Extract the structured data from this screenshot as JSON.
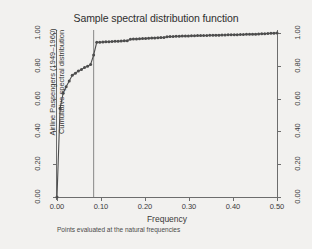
{
  "chart_data": {
    "type": "line",
    "title": "Sample spectral distribution function",
    "xlabel": "Frequency",
    "ylabel": "Airline Passengers (1949–1960) Cumulative spectral distribution",
    "ylabel_line1": "Airline Passengers (1949–1960)",
    "ylabel_line2": "Cumulative spectral distribution",
    "note": "Points evaluated at the natural frequencies",
    "xlim": [
      0.0,
      0.5
    ],
    "ylim": [
      0.0,
      1.0
    ],
    "grid": false,
    "legend": "none",
    "marker": "filled-circle",
    "marker_color": "#4d4d4d",
    "line_color": "#4d4d4d",
    "background_color": "#f2f1ef",
    "axis_color": "#6d6d6d",
    "xticks": [
      "0.00",
      "0.10",
      "0.20",
      "0.30",
      "0.40",
      "0.50"
    ],
    "xtick_values": [
      0.0,
      0.1,
      0.2,
      0.3,
      0.4,
      0.5
    ],
    "yticks_left": [
      "0.00",
      "0.20",
      "0.40",
      "0.60",
      "0.80",
      "1.00"
    ],
    "ytick_values_left": [
      0.0,
      0.2,
      0.4,
      0.6,
      0.8,
      1.0
    ],
    "yticks_right": [
      "0.00",
      "0.20",
      "0.40",
      "0.60",
      "0.80",
      "1.00"
    ],
    "ytick_values_right": [
      0.0,
      0.2,
      0.4,
      0.6,
      0.8,
      1.0
    ],
    "reference_line": {
      "orientation": "vertical",
      "x": 0.0833,
      "color": "#6d6d6d"
    },
    "series": [
      {
        "name": "Cumulative spectral distribution",
        "x": [
          0.0,
          0.0069,
          0.0139,
          0.0208,
          0.0278,
          0.0347,
          0.0417,
          0.0486,
          0.0556,
          0.0625,
          0.0694,
          0.0764,
          0.0833,
          0.0903,
          0.0972,
          0.1042,
          0.1111,
          0.1181,
          0.125,
          0.1319,
          0.1389,
          0.1458,
          0.1528,
          0.1597,
          0.1667,
          0.1736,
          0.1806,
          0.1875,
          0.1944,
          0.2014,
          0.2083,
          0.2153,
          0.2222,
          0.2292,
          0.2361,
          0.2431,
          0.25,
          0.2569,
          0.2639,
          0.2708,
          0.2778,
          0.2847,
          0.2917,
          0.2986,
          0.3056,
          0.3125,
          0.3194,
          0.3264,
          0.3333,
          0.3403,
          0.3472,
          0.3542,
          0.3611,
          0.3681,
          0.375,
          0.3819,
          0.3889,
          0.3958,
          0.4028,
          0.4097,
          0.4167,
          0.4236,
          0.4306,
          0.4375,
          0.4444,
          0.4514,
          0.4583,
          0.4653,
          0.4722,
          0.4792,
          0.4861,
          0.4931,
          0.5
        ],
        "y": [
          0.0,
          0.54,
          0.632,
          0.672,
          0.708,
          0.742,
          0.755,
          0.769,
          0.778,
          0.789,
          0.797,
          0.808,
          0.866,
          0.943,
          0.944,
          0.945,
          0.946,
          0.947,
          0.948,
          0.949,
          0.95,
          0.951,
          0.952,
          0.953,
          0.962,
          0.963,
          0.964,
          0.965,
          0.966,
          0.967,
          0.968,
          0.969,
          0.97,
          0.971,
          0.972,
          0.973,
          0.977,
          0.978,
          0.979,
          0.98,
          0.98,
          0.981,
          0.982,
          0.982,
          0.983,
          0.983,
          0.984,
          0.984,
          0.985,
          0.985,
          0.986,
          0.986,
          0.987,
          0.987,
          0.988,
          0.988,
          0.989,
          0.989,
          0.99,
          0.99,
          0.991,
          0.991,
          0.992,
          0.992,
          0.993,
          0.993,
          0.994,
          0.995,
          0.996,
          0.997,
          0.998,
          0.999,
          1.0
        ]
      }
    ]
  }
}
